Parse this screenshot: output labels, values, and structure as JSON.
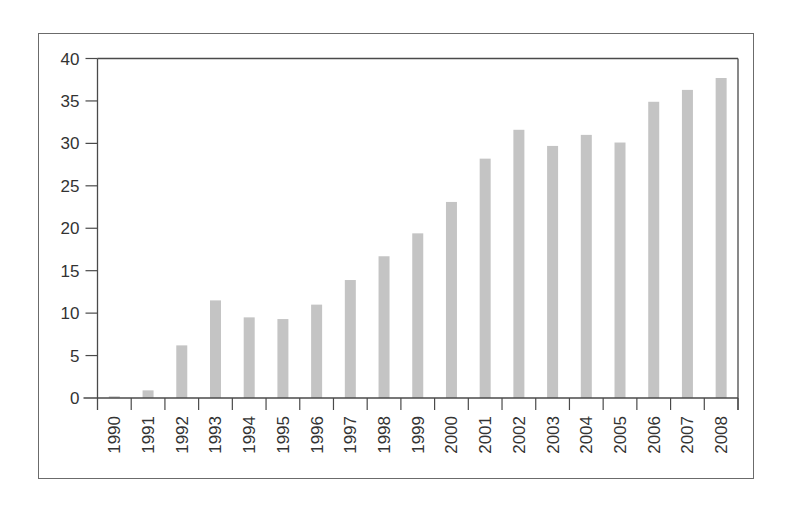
{
  "chart_data": {
    "type": "bar",
    "title": "",
    "xlabel": "",
    "ylabel": "",
    "categories": [
      "1990",
      "1991",
      "1992",
      "1993",
      "1994",
      "1995",
      "1996",
      "1997",
      "1998",
      "1999",
      "2000",
      "2001",
      "2002",
      "2003",
      "2004",
      "2005",
      "2006",
      "2007",
      "2008"
    ],
    "values": [
      0.2,
      0.9,
      6.2,
      11.5,
      9.5,
      9.3,
      11.0,
      13.9,
      16.7,
      19.4,
      23.1,
      28.2,
      31.6,
      29.7,
      31.0,
      30.1,
      34.9,
      36.3,
      37.7
    ],
    "ylim": [
      0,
      40
    ],
    "yticks": [
      0,
      5,
      10,
      15,
      20,
      25,
      30,
      35,
      40
    ],
    "grid": false,
    "legend": null,
    "xtick_rotation": -90,
    "colors": {
      "bar": "#c4c4c4",
      "axis": "#4a4a4a",
      "frame": "#6b6b6b",
      "text": "#333333"
    }
  }
}
